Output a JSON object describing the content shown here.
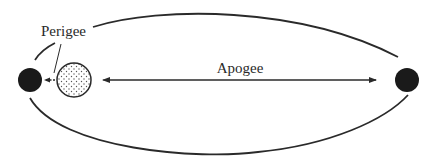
{
  "diagram": {
    "type": "orbit",
    "labels": {
      "perigee": "Perigee",
      "apogee": "Apogee"
    },
    "colors": {
      "stroke": "#2a2a2a",
      "moon_fill": "#1a1a1a",
      "earth_fill": "#ffffff",
      "earth_dots": "#555555"
    },
    "bodies": [
      {
        "name": "moon-at-perigee",
        "fill": "solid-black"
      },
      {
        "name": "earth",
        "fill": "dotted"
      },
      {
        "name": "moon-at-apogee",
        "fill": "solid-black"
      }
    ]
  }
}
